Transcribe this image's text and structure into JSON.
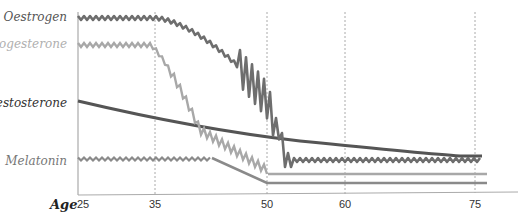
{
  "chart_data": {
    "type": "line",
    "title": "",
    "xlabel": "Age",
    "ylabel": "",
    "x_ticks": [
      25,
      35,
      50,
      60,
      75
    ],
    "xlim": [
      25,
      78
    ],
    "grid": {
      "vertical_dashed_at": [
        35,
        50,
        60,
        75
      ],
      "horizontal": false
    },
    "legend": "inline labels on left",
    "series": [
      {
        "name": "Oestrogen",
        "color": "#6e6e6e",
        "style": "wavy",
        "points": [
          [
            25,
            0.95
          ],
          [
            35,
            0.93
          ],
          [
            40,
            0.85
          ],
          [
            45,
            0.72
          ],
          [
            47,
            0.62
          ],
          [
            48,
            0.55
          ],
          [
            50,
            0.45
          ],
          [
            51,
            0.25
          ],
          [
            52,
            0.1
          ],
          [
            55,
            0.05
          ],
          [
            75,
            0.05
          ]
        ],
        "note": "high-amplitude oscillation between ages ~46 and ~51"
      },
      {
        "name": "Progesterone",
        "color": "#a8a8a8",
        "style": "wavy",
        "points": [
          [
            25,
            0.8
          ],
          [
            35,
            0.78
          ],
          [
            38,
            0.7
          ],
          [
            40,
            0.5
          ],
          [
            42,
            0.3
          ],
          [
            45,
            0.18
          ],
          [
            50,
            0.12
          ],
          [
            51,
            -0.02
          ],
          [
            75,
            -0.02
          ]
        ]
      },
      {
        "name": "Testosterone",
        "color": "#555555",
        "style": "smooth",
        "points": [
          [
            25,
            0.55
          ],
          [
            35,
            0.46
          ],
          [
            50,
            0.32
          ],
          [
            60,
            0.28
          ],
          [
            75,
            0.22
          ],
          [
            76,
            0.22
          ]
        ]
      },
      {
        "name": "Melatonin",
        "color": "#8a8a8a",
        "style": "wavy",
        "points": [
          [
            25,
            0.18
          ],
          [
            42,
            0.18
          ],
          [
            50,
            0.02
          ],
          [
            51,
            -0.06
          ],
          [
            76,
            -0.06
          ]
        ]
      }
    ]
  },
  "labels": {
    "oestrogen": "Oestrogen",
    "progesterone": "Progesterone",
    "testosterone": "Testosterone",
    "melatonin": "Melatonin",
    "age": "Age"
  },
  "ticks": [
    "25",
    "35",
    "50",
    "60",
    "75"
  ],
  "colors": {
    "oestrogen": "#6e6e6e",
    "progesterone": "#a8a8a8",
    "testosterone": "#555555",
    "melatonin": "#8a8a8a",
    "label_dark": "#555555",
    "label_light": "#b0b0b0",
    "grid": "#aaaaaa",
    "axis": "#999999"
  }
}
